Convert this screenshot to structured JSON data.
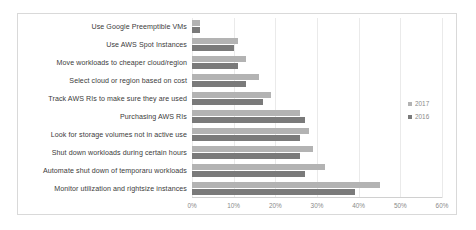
{
  "chart_data": {
    "type": "bar",
    "orientation": "horizontal",
    "title": "",
    "subtitle": "",
    "xlabel": "",
    "ylabel": "",
    "xlim": [
      0,
      60
    ],
    "ylim": null,
    "grid": true,
    "legend_position": "right",
    "xticks": [
      "0%",
      "10%",
      "20%",
      "30%",
      "40%",
      "50%",
      "60%"
    ],
    "xtick_values": [
      0,
      10,
      20,
      30,
      40,
      50,
      60
    ],
    "categories": [
      "Use Google Preemptible VMs",
      "Use AWS Spot Instances",
      "Move workloads to cheaper cloud/region",
      "Select cloud or region based on cost",
      "Track AWS RIs to make sure they are used",
      "Purchasing AWS RIs",
      "Look for storage volumes not in active use",
      "Shut down workloads during certain hours",
      "Automate shut down of temporaru workloads",
      "Monitor utilization and rightsize instances"
    ],
    "series": [
      {
        "name": "2017",
        "color": "#b3b3b3",
        "values": [
          2,
          11,
          13,
          16,
          19,
          26,
          28,
          29,
          32,
          45
        ]
      },
      {
        "name": "2016",
        "color": "#7a7a7a",
        "values": [
          2,
          10,
          11,
          13,
          17,
          27,
          26,
          26,
          27,
          39
        ]
      }
    ]
  },
  "legend": {
    "items": [
      {
        "label": "2017",
        "color": "#b3b3b3"
      },
      {
        "label": "2016",
        "color": "#7a7a7a"
      }
    ]
  }
}
